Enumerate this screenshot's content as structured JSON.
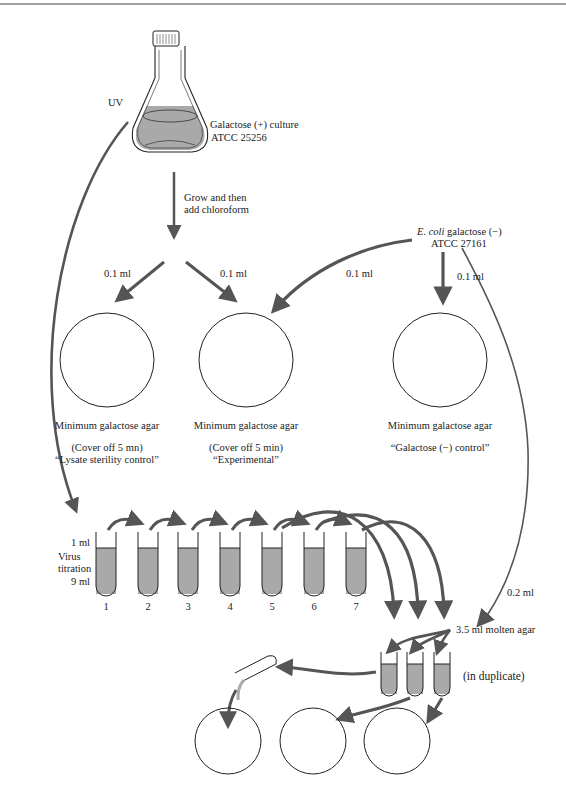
{
  "diagram": {
    "colors": {
      "line": "#2b2b2b",
      "arrow": "#555555",
      "liquid": "#a9a9a9",
      "background": "#ffffff"
    },
    "flask": {
      "uv_label": "UV",
      "culture_label_1": "Galactose (+) culture",
      "culture_label_2": "ATCC 25256"
    },
    "step1": {
      "label_1": "Grow and then",
      "label_2": "add chloroform"
    },
    "ecoli": {
      "name_italic": "E. coli",
      "name_rest": " galactose (−)",
      "atcc": "ATCC 27161"
    },
    "volumes": {
      "lysate_left": "0.1 ml",
      "lysate_right": "0.1 ml",
      "ecoli_to_experimental": "0.1 ml",
      "ecoli_to_control": "0.1 ml",
      "ecoli_to_soft_agar": "0.2 ml"
    },
    "plates": [
      {
        "medium": "Minimum galactose agar",
        "note": "(Cover off 5 mn)",
        "role": "“Lysate sterility control”"
      },
      {
        "medium": "Minimum galactose agar",
        "note": "(Cover off 5 min)",
        "role": "“Experimental”"
      },
      {
        "medium": "Minimum galactose agar",
        "note": "“Galactose (−) control”",
        "role": ""
      }
    ],
    "titration": {
      "label_top": "1 ml",
      "label_mid_1": "Virus",
      "label_mid_2": "titration",
      "label_bottom": "9 ml",
      "tubes": [
        "1",
        "2",
        "3",
        "4",
        "5",
        "6",
        "7"
      ]
    },
    "soft_agar": {
      "label": "3.5 ml molten agar",
      "duplicate": "(in duplicate)"
    },
    "icons": [
      "flask-icon",
      "petri-dish-icon",
      "test-tube-icon",
      "pipette-icon",
      "arrow-icon"
    ]
  }
}
